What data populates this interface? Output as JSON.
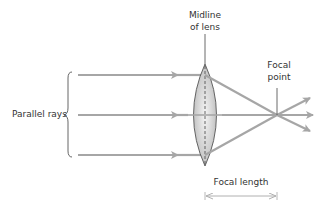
{
  "diagram": {
    "labels": {
      "midline_line1": "Midline",
      "midline_line2": "of lens",
      "focal_point_line1": "Focal",
      "focal_point_line2": "point",
      "parallel_rays": "Parallel rays",
      "focal_length": "Focal length"
    },
    "rays": [
      {
        "name": "top-ray",
        "y_in": 75,
        "exit": [
          310,
          98
        ]
      },
      {
        "name": "middle-ray",
        "y_in": 115,
        "exit": [
          312,
          115
        ]
      },
      {
        "name": "bottom-ray",
        "y_in": 155,
        "exit": [
          310,
          130
        ]
      }
    ],
    "lens": {
      "center_x": 205,
      "top_y": 64,
      "bottom_y": 166,
      "half_width": 23
    },
    "focal_point": [
      277,
      115
    ],
    "colors": {
      "ray": "#a6a6a6",
      "lens_fill_edge": "#bdbdbd",
      "lens_fill_center": "#f2f2f2",
      "lens_stroke": "#555555",
      "text": "#333333",
      "pointer_line": "#444444"
    }
  }
}
